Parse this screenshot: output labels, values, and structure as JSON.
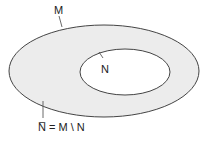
{
  "diagram": {
    "type": "set-diagram",
    "colors": {
      "fill": "#ececec",
      "stroke": "#444444",
      "inner_fill": "#ffffff"
    },
    "labels": {
      "outer_set": "M",
      "inner_set": "N",
      "complement": "N̅ = M \\ N"
    },
    "outer_ellipse": {
      "cx": 104,
      "cy": 71,
      "rx": 95,
      "ry": 47
    },
    "inner_ellipse": {
      "cx": 125,
      "cy": 71,
      "rx": 45,
      "ry": 24
    }
  }
}
